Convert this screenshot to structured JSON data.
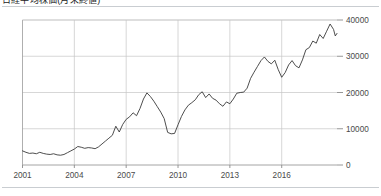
{
  "header": {
    "title": "日経平均株価(月末終値)",
    "legend_swatch_color": "#2b2b2b",
    "rule_color": "#c9cdd1"
  },
  "chart_data": {
    "type": "line",
    "title": "",
    "xlabel": "",
    "ylabel": "",
    "grid": true,
    "legend_position": "none",
    "xlim": [
      2001,
      2019.2
    ],
    "ylim": [
      0,
      40000
    ],
    "x_ticks": [
      2001,
      2004,
      2007,
      2010,
      2013,
      2016
    ],
    "x_tick_labels": [
      "2001",
      "2004",
      "2007",
      "2010",
      "2013",
      "2016"
    ],
    "y_ticks": [
      0,
      10000,
      20000,
      30000,
      40000
    ],
    "y_tick_labels": [
      "0",
      "10000",
      "20000",
      "30000",
      "40000"
    ],
    "series": [
      {
        "name": "index",
        "color": "#3a3a3a",
        "x": [
          2001.0,
          2001.2,
          2001.4,
          2001.6,
          2001.8,
          2002.0,
          2002.2,
          2002.4,
          2002.6,
          2002.8,
          2003.0,
          2003.2,
          2003.4,
          2003.6,
          2003.8,
          2004.0,
          2004.2,
          2004.4,
          2004.6,
          2004.8,
          2005.0,
          2005.2,
          2005.4,
          2005.6,
          2005.8,
          2006.0,
          2006.2,
          2006.4,
          2006.6,
          2006.8,
          2007.0,
          2007.2,
          2007.4,
          2007.6,
          2007.8,
          2008.0,
          2008.2,
          2008.4,
          2008.6,
          2008.8,
          2009.0,
          2009.2,
          2009.4,
          2009.6,
          2009.8,
          2010.0,
          2010.2,
          2010.4,
          2010.6,
          2010.8,
          2011.0,
          2011.2,
          2011.4,
          2011.6,
          2011.8,
          2012.0,
          2012.2,
          2012.4,
          2012.6,
          2012.8,
          2013.0,
          2013.2,
          2013.4,
          2013.6,
          2013.8,
          2014.0,
          2014.2,
          2014.4,
          2014.6,
          2014.8,
          2015.0,
          2015.2,
          2015.4,
          2015.6,
          2015.8,
          2016.0,
          2016.2,
          2016.4,
          2016.6,
          2016.8,
          2017.0,
          2017.2,
          2017.4,
          2017.6,
          2017.8,
          2018.0,
          2018.2,
          2018.4,
          2018.6,
          2018.8,
          2019.0,
          2019.1,
          2019.2
        ],
        "y": [
          3900,
          3500,
          3200,
          3300,
          3100,
          3500,
          3200,
          3000,
          2900,
          3100,
          2800,
          2700,
          2900,
          3400,
          3900,
          4400,
          5100,
          4900,
          4600,
          4800,
          4700,
          4500,
          5000,
          5800,
          6600,
          7400,
          8200,
          10700,
          9100,
          11200,
          12600,
          13300,
          14400,
          13600,
          15600,
          18200,
          19900,
          18900,
          17600,
          16100,
          14600,
          12800,
          9000,
          8600,
          8700,
          11100,
          13400,
          15200,
          16500,
          17200,
          18000,
          19400,
          20200,
          18600,
          19600,
          18400,
          17900,
          16900,
          16200,
          17400,
          16900,
          18200,
          19800,
          20000,
          20100,
          21200,
          23900,
          25600,
          27200,
          28800,
          29800,
          28600,
          27900,
          28900,
          26300,
          24200,
          25500,
          27600,
          28800,
          27400,
          26800,
          29000,
          31800,
          32400,
          34200,
          33600,
          36000,
          34900,
          36900,
          38900,
          37400,
          35600,
          36300
        ]
      }
    ]
  }
}
